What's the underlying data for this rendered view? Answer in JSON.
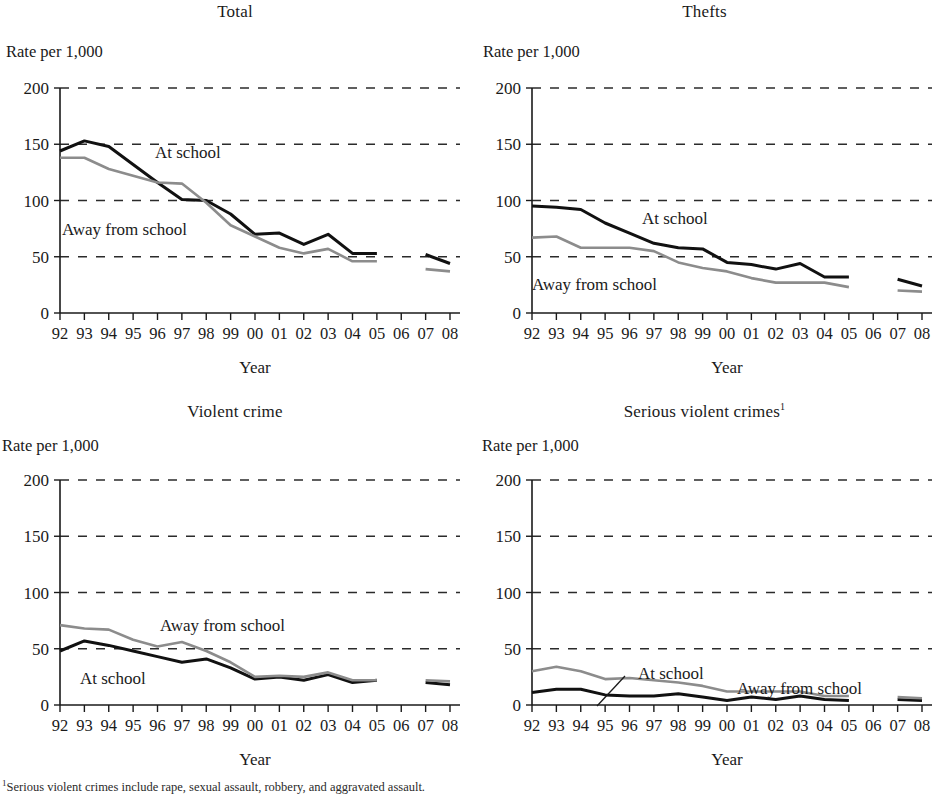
{
  "figure": {
    "footnote_marker": "1",
    "footnote_text": "Serious violent crimes include rape, sexual assault, robbery, and aggravated assault.",
    "xlabel": "Year",
    "ylabel": "Rate per 1,000",
    "year_ticks": [
      "92",
      "93",
      "94",
      "95",
      "96",
      "97",
      "98",
      "99",
      "00",
      "01",
      "02",
      "03",
      "04",
      "05",
      "06",
      "07",
      "08"
    ],
    "y_ticks": [
      "0",
      "50",
      "100",
      "150",
      "200"
    ],
    "colors": {
      "at_school": "#111111",
      "away_from_school": "#8c8c8c",
      "gridline": "#2b2b2b",
      "axis": "#1a1a1a",
      "text": "#1a1a1a"
    },
    "series_names": {
      "at_school": "At school",
      "away_from_school": "Away from school"
    }
  },
  "chart_data": [
    {
      "id": "total",
      "type": "line",
      "title": "Total",
      "xlabel": "Year",
      "ylabel": "Rate per 1,000",
      "ylim": [
        0,
        200
      ],
      "yticks": [
        0,
        50,
        100,
        150,
        200
      ],
      "grid": "horizontal-dashed",
      "legend": "inline-annotations",
      "x": [
        "92",
        "93",
        "94",
        "95",
        "96",
        "97",
        "98",
        "99",
        "00",
        "01",
        "02",
        "03",
        "04",
        "05",
        "06",
        "07",
        "08"
      ],
      "series": [
        {
          "name": "At school",
          "color": "#111111",
          "values": [
            144,
            153,
            148,
            132,
            116,
            101,
            100,
            88,
            70,
            71,
            61,
            70,
            53,
            53,
            null,
            52,
            44
          ]
        },
        {
          "name": "Away from school",
          "color": "#8c8c8c",
          "values": [
            138,
            138,
            128,
            122,
            116,
            115,
            98,
            78,
            68,
            58,
            53,
            57,
            46,
            46,
            null,
            39,
            37
          ]
        }
      ],
      "annotations": [
        {
          "text": "At school",
          "x": 155,
          "y": 158
        },
        {
          "text": "Away from school",
          "x": 62,
          "y": 235
        }
      ],
      "notes": "Data gap between 2005 and 2007; 2006 not collected."
    },
    {
      "id": "thefts",
      "type": "line",
      "title": "Thefts",
      "xlabel": "Year",
      "ylabel": "Rate per 1,000",
      "ylim": [
        0,
        200
      ],
      "yticks": [
        0,
        50,
        100,
        150,
        200
      ],
      "grid": "horizontal-dashed",
      "legend": "inline-annotations",
      "x": [
        "92",
        "93",
        "94",
        "95",
        "96",
        "97",
        "98",
        "99",
        "00",
        "01",
        "02",
        "03",
        "04",
        "05",
        "06",
        "07",
        "08"
      ],
      "series": [
        {
          "name": "At school",
          "color": "#111111",
          "values": [
            95,
            94,
            92,
            80,
            71,
            62,
            58,
            57,
            45,
            43,
            39,
            44,
            32,
            32,
            null,
            30,
            24
          ]
        },
        {
          "name": "Away from school",
          "color": "#8c8c8c",
          "values": [
            67,
            68,
            58,
            58,
            58,
            55,
            45,
            40,
            37,
            31,
            27,
            27,
            27,
            23,
            null,
            20,
            19
          ]
        }
      ],
      "annotations": [
        {
          "text": "At school",
          "x": 642,
          "y": 224
        },
        {
          "text": "Away from school",
          "x": 532,
          "y": 290
        }
      ],
      "notes": "Data gap between 2005 and 2007; 2006 not collected."
    },
    {
      "id": "violent-crime",
      "type": "line",
      "title": "Violent crime",
      "xlabel": "Year",
      "ylabel": "Rate per 1,000",
      "ylim": [
        0,
        200
      ],
      "yticks": [
        0,
        50,
        100,
        150,
        200
      ],
      "grid": "horizontal-dashed",
      "legend": "inline-annotations",
      "x": [
        "92",
        "93",
        "94",
        "95",
        "96",
        "97",
        "98",
        "99",
        "00",
        "01",
        "02",
        "03",
        "04",
        "05",
        "06",
        "07",
        "08"
      ],
      "series": [
        {
          "name": "At school",
          "color": "#111111",
          "values": [
            48,
            57,
            53,
            48,
            43,
            38,
            41,
            33,
            23,
            25,
            22,
            27,
            20,
            22,
            null,
            20,
            18
          ]
        },
        {
          "name": "Away from school",
          "color": "#8c8c8c",
          "values": [
            71,
            68,
            67,
            58,
            52,
            56,
            48,
            38,
            25,
            26,
            25,
            29,
            22,
            22,
            null,
            22,
            21
          ]
        }
      ],
      "annotations": [
        {
          "text": "Away from school",
          "x": 160,
          "y": 631
        },
        {
          "text": "At school",
          "x": 80,
          "y": 684
        }
      ],
      "notes": "Data gap between 2005 and 2007; 2006 not collected."
    },
    {
      "id": "serious-violent-crimes",
      "type": "line",
      "title": "Serious violent crimes",
      "title_superscript": "1",
      "xlabel": "Year",
      "ylabel": "Rate per 1,000",
      "ylim": [
        0,
        200
      ],
      "yticks": [
        0,
        50,
        100,
        150,
        200
      ],
      "grid": "horizontal-dashed",
      "legend": "inline-annotations",
      "x": [
        "92",
        "93",
        "94",
        "95",
        "96",
        "97",
        "98",
        "99",
        "00",
        "01",
        "02",
        "03",
        "04",
        "05",
        "06",
        "07",
        "08"
      ],
      "series": [
        {
          "name": "At school",
          "color": "#111111",
          "values": [
            11,
            14,
            14,
            9,
            8,
            8,
            10,
            7,
            4,
            7,
            5,
            8,
            5,
            4,
            null,
            5,
            4
          ]
        },
        {
          "name": "Away from school",
          "color": "#8c8c8c",
          "values": [
            30,
            34,
            30,
            23,
            24,
            22,
            20,
            17,
            12,
            12,
            12,
            12,
            8,
            8,
            null,
            7,
            6
          ]
        }
      ],
      "annotations": [
        {
          "text": "At school",
          "x": 638,
          "y": 679
        },
        {
          "text": "Away from school",
          "x": 737,
          "y": 694
        }
      ],
      "callout": {
        "from_x": 625,
        "from_y": 676,
        "to_x": 597,
        "to_y": 706
      },
      "notes": "Data gap between 2005 and 2007; 2006 not collected."
    }
  ]
}
